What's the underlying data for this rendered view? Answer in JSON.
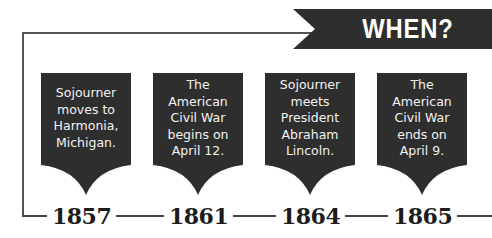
{
  "banner": {
    "title": "WHEN?",
    "color": "#2e2e2e"
  },
  "card_color": "#2e2e2e",
  "events": [
    {
      "text": "Sojourner moves to Harmonia, Michigan.",
      "lines": [
        "Sojourner",
        "moves to",
        "Harmonia,",
        "Michigan."
      ],
      "year": "1857"
    },
    {
      "text": "The American Civil War begins on April 12.",
      "lines": [
        "The",
        "American",
        "Civil War",
        "begins on",
        "April 12."
      ],
      "year": "1861"
    },
    {
      "text": "Sojourner meets President Abraham Lincoln.",
      "lines": [
        "Sojourner",
        "meets",
        "President",
        "Abraham",
        "Lincoln."
      ],
      "year": "1864"
    },
    {
      "text": "The American Civil War ends on April 9.",
      "lines": [
        "The",
        "American",
        "Civil War",
        "ends on",
        "April 9."
      ],
      "year": "1865"
    }
  ]
}
